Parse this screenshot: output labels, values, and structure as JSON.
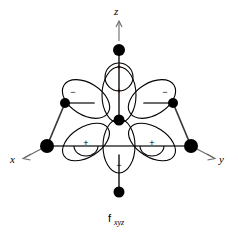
{
  "figure": {
    "title_main": "f",
    "title_subscript": "xyz",
    "background_color": "#ffffff",
    "line_color": "#000000",
    "bond_color": "#3a3a3a",
    "axis_color": "#6b6b6b"
  },
  "axes": [
    {
      "name": "z-axis",
      "label": "z",
      "direction": "up"
    },
    {
      "name": "x-axis",
      "label": "x",
      "direction": "down-left"
    },
    {
      "name": "y-axis",
      "label": "y",
      "direction": "down-right"
    }
  ],
  "signs": {
    "upper_left": "−",
    "upper_center": "+",
    "upper_right": "−",
    "top_cap": "+",
    "lower_left": "+",
    "lower_right": "+",
    "bottom_cap": "−"
  },
  "vertices": [
    {
      "name": "top-z-vertex",
      "cx": 119,
      "cy": 50,
      "r": 6.0
    },
    {
      "name": "center-nucleus",
      "cx": 119,
      "cy": 120,
      "r": 5.5
    },
    {
      "name": "bottom-vertex",
      "cx": 119,
      "cy": 192,
      "r": 5.5
    },
    {
      "name": "upper-left-vertex",
      "cx": 65,
      "cy": 103,
      "r": 5.0
    },
    {
      "name": "upper-right-vertex",
      "cx": 173,
      "cy": 103,
      "r": 5.0
    },
    {
      "name": "left-x-vertex",
      "cx": 47,
      "cy": 146,
      "r": 7.0
    },
    {
      "name": "right-y-vertex",
      "cx": 191,
      "cy": 146,
      "r": 7.0
    }
  ]
}
